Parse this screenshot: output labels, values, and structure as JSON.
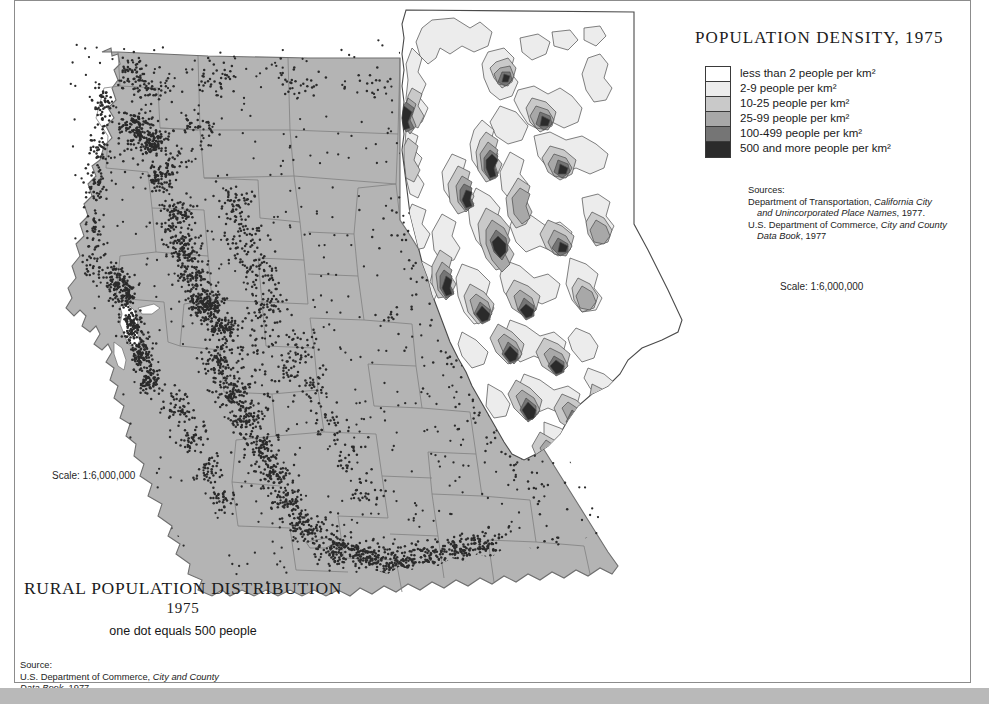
{
  "page": {
    "background": "#ffffff",
    "frame_color": "#8c8c8c"
  },
  "density_map": {
    "title": "POPULATION DENSITY, 1975",
    "scale": "Scale: 1:6,000,000",
    "legend": [
      {
        "label": "less than 2 people per km²",
        "color": "#ffffff"
      },
      {
        "label": "2-9 people per km²",
        "color": "#ececec"
      },
      {
        "label": "10-25 people per km²",
        "color": "#c9c9c9"
      },
      {
        "label": "25-99 people per km²",
        "color": "#a8a8a8"
      },
      {
        "label": "100-499 people per km²",
        "color": "#757575"
      },
      {
        "label": "500 and more people per km²",
        "color": "#2b2b2b"
      }
    ],
    "sources": {
      "heading": "Sources:",
      "line1": "Department of Transportation,",
      "line1_italic": "California City",
      "line2_italic": "and Unincorporated Place Names",
      "line2_tail": ", 1977.",
      "line3": "U.S. Department of Commerce,",
      "line3_italic": "City and County",
      "line4_italic": "Data Book",
      "line4_tail": ", 1977"
    }
  },
  "rural_map": {
    "title": "RURAL POPULATION DISTRIBUTION",
    "year": "1975",
    "subtitle": "one dot equals 500 people",
    "scale": "Scale: 1:6,000,000",
    "fill_color": "#b4b4b4",
    "dot_color": "#2b2b2b",
    "county_line_color": "#7b7b7b",
    "sources": {
      "heading": "Source:",
      "line1": "U.S. Department of Commerce,",
      "line1_italic": "City and County",
      "line2_italic": "Data Book",
      "line2_tail": ", 1977"
    }
  }
}
